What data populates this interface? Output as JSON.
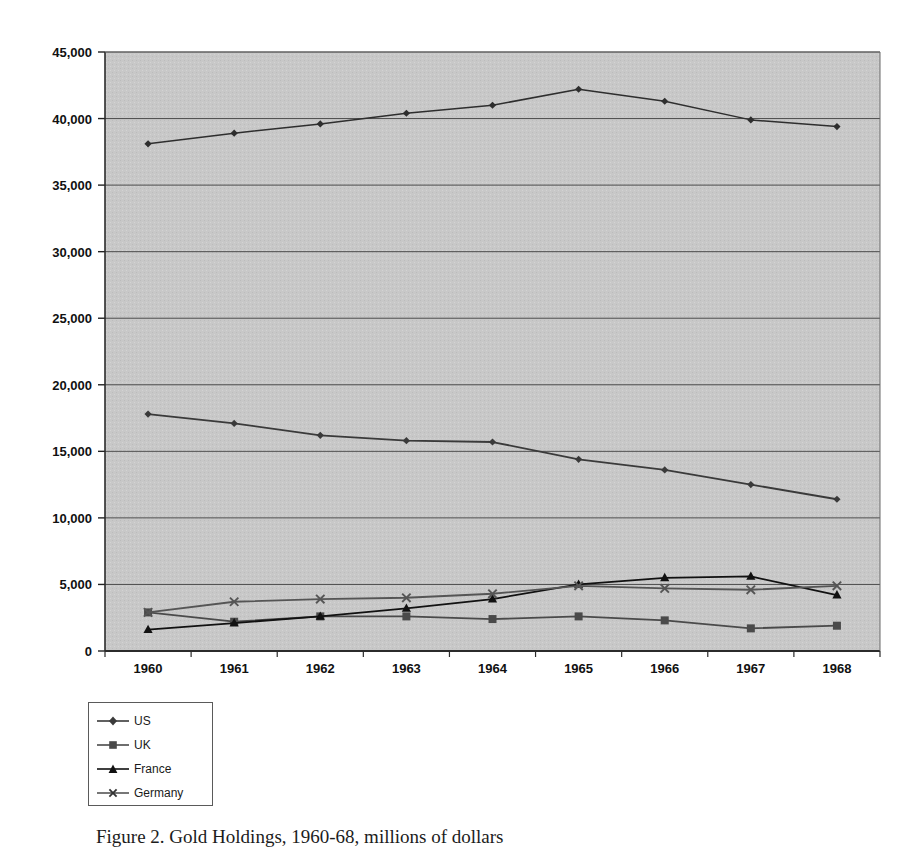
{
  "figure": {
    "caption": "Figure 2. Gold Holdings, 1960-68, millions of dollars"
  },
  "legend": {
    "position": "below-left",
    "items": [
      {
        "label": "US",
        "marker": "diamond-marker-icon",
        "color": "#3a3a3a"
      },
      {
        "label": "UK",
        "marker": "square-marker-icon",
        "color": "#4a4a4a"
      },
      {
        "label": "France",
        "marker": "triangle-marker-icon",
        "color": "#111111"
      },
      {
        "label": "Germany",
        "marker": "x-marker-icon",
        "color": "#555555"
      }
    ]
  },
  "axes": {
    "y_ticks": [
      "0",
      "5,000",
      "10,000",
      "15,000",
      "20,000",
      "25,000",
      "30,000",
      "35,000",
      "40,000",
      "45,000"
    ],
    "x_ticks": [
      "1960",
      "1961",
      "1962",
      "1963",
      "1964",
      "1965",
      "1966",
      "1967",
      "1968"
    ]
  },
  "chart_data": {
    "type": "line",
    "title": "",
    "subtitle": "",
    "xlabel": "",
    "ylabel": "",
    "xlim": [
      1960,
      1968
    ],
    "ylim": [
      0,
      45000
    ],
    "ytick_step": 5000,
    "grid": true,
    "plot_background": "#c8c8c8",
    "legend_position": "below-left",
    "x": [
      1960,
      1961,
      1962,
      1963,
      1964,
      1965,
      1966,
      1967,
      1968
    ],
    "categories": [
      "1960",
      "1961",
      "1962",
      "1963",
      "1964",
      "1965",
      "1966",
      "1967",
      "1968"
    ],
    "series": [
      {
        "name": "Total",
        "marker": "diamond",
        "color": "#2e2e2e",
        "values": [
          38100,
          38900,
          39600,
          40400,
          41000,
          42200,
          41300,
          39900,
          39400
        ]
      },
      {
        "name": "US",
        "marker": "diamond",
        "color": "#3a3a3a",
        "values": [
          17800,
          17100,
          16200,
          15800,
          15700,
          14400,
          13600,
          12500,
          11400
        ]
      },
      {
        "name": "UK",
        "marker": "square",
        "color": "#4a4a4a",
        "values": [
          2900,
          2200,
          2600,
          2600,
          2400,
          2600,
          2300,
          1700,
          1900
        ]
      },
      {
        "name": "France",
        "marker": "triangle",
        "color": "#111111",
        "values": [
          1600,
          2100,
          2600,
          3200,
          3900,
          5000,
          5500,
          5600,
          4200
        ]
      },
      {
        "name": "Germany",
        "marker": "x",
        "color": "#555555",
        "values": [
          2900,
          3700,
          3900,
          4000,
          4300,
          4900,
          4700,
          4600,
          4900
        ]
      }
    ]
  }
}
